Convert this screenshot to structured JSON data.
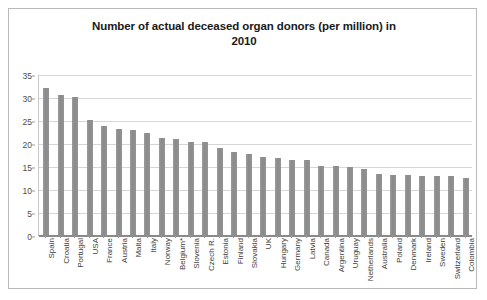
{
  "chart_data": {
    "type": "bar",
    "title": "Number of actual deceased organ donors (per million) in 2010",
    "title_line1": "Number of actual deceased organ donors (per million) in",
    "title_line2": "2010",
    "xlabel": "",
    "ylabel": "",
    "ylim": [
      0,
      35
    ],
    "ytick_step": 5,
    "yticks": [
      "0",
      "5",
      "10",
      "15",
      "20",
      "25",
      "30",
      "35"
    ],
    "grid": true,
    "legend": "none",
    "bar_color": "#8f8f8f",
    "categories": [
      "Spain",
      "Croatia",
      "Portugal",
      "USA",
      "France",
      "Austria",
      "Malta",
      "Italy",
      "Norway",
      "Belgium*",
      "Slovenia",
      "Czech R.",
      "Estonia",
      "Finland",
      "Slovakia",
      "UK",
      "Hungary",
      "Germany",
      "Latvia",
      "Canada",
      "Argentina",
      "Uruguay",
      "Netherlands",
      "Australia",
      "Poland",
      "Denmark",
      "Ireland",
      "Sweden",
      "Switzerland",
      "Colombia"
    ],
    "values": [
      32.0,
      30.5,
      30.0,
      25.0,
      23.8,
      23.0,
      22.8,
      22.2,
      21.0,
      20.8,
      20.2,
      20.2,
      19.0,
      18.0,
      17.6,
      17.0,
      16.8,
      16.4,
      16.2,
      15.0,
      14.9,
      14.8,
      14.4,
      13.2,
      13.0,
      13.0,
      12.8,
      12.8,
      12.8,
      12.4
    ]
  },
  "footnote": {
    "belgium_note": "*"
  }
}
